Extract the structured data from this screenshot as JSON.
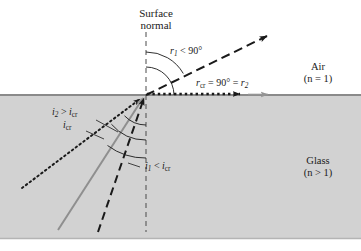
{
  "figure": {
    "normal_label_line1": "Surface",
    "normal_label_line2": "normal",
    "media": {
      "upper_name": "Air",
      "upper_index": "(n = 1)",
      "lower_name": "Glass",
      "lower_index": "(n > 1)"
    },
    "angles": {
      "refracted_r1": {
        "symbol": "r",
        "sub": "1",
        "relation": " < 90°"
      },
      "critical_r": {
        "symbol": "r",
        "sub": "cr",
        "relation": " = 90° = ",
        "symbol2": "r",
        "sub2": "2"
      },
      "incident_i1": {
        "symbol": "i",
        "sub": "1",
        "relation": " < ",
        "symbol2": "i",
        "sub2": "cr"
      },
      "incident_i2": {
        "symbol": "i",
        "sub": "2",
        "relation": " > ",
        "symbol2": "i",
        "sub2": "cr"
      },
      "incident_icr": {
        "symbol": "i",
        "sub": "cr"
      }
    },
    "colors": {
      "glass_fill": "#d2d2d2",
      "air_fill": "#ffffff",
      "interface_line": "#8a8a8a",
      "ink": "#1a1a1a",
      "gray_ray": "#8f8f8f",
      "border": "#b4b4b4"
    },
    "geometry": {
      "interface_y": 95,
      "vertex_x": 146,
      "vertex_y": 95,
      "normal_top": 32,
      "normal_bottom": 232
    },
    "rays": [
      {
        "name": "incident-ray-1-dashed",
        "style": "dashed",
        "color": "ink",
        "note": "i1 < icr, refracts into air"
      },
      {
        "name": "incident-ray-critical-solid",
        "style": "solid",
        "color": "gray_ray",
        "note": "icr, refracts along surface"
      },
      {
        "name": "incident-ray-2-dotted",
        "style": "dotted",
        "color": "ink",
        "note": "i2 > icr, totally internally reflected"
      },
      {
        "name": "refracted-ray-dashed",
        "style": "dashed",
        "color": "ink",
        "note": "r1 < 90 into air"
      },
      {
        "name": "grazing-ray-dotted",
        "style": "dotted",
        "color": "ink",
        "note": "r = 90 along interface"
      }
    ]
  }
}
